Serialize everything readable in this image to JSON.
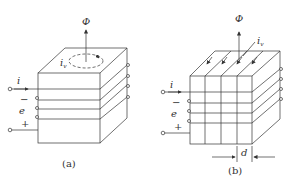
{
  "figures": [
    {
      "id": "a",
      "caption": "(a)",
      "flux_label": "Φ",
      "eddy_label": "i",
      "eddy_sub": "v",
      "current_label": "i",
      "emf_label": "e",
      "minus_label": "−",
      "plus_label": "+",
      "description": "Solid core with single large eddy current loop on top face"
    },
    {
      "id": "b",
      "caption": "(b)",
      "flux_label": "Φ",
      "eddy_label": "i",
      "eddy_sub": "v",
      "current_label": "i",
      "emf_label": "e",
      "minus_label": "−",
      "plus_label": "+",
      "dimension_label": "d",
      "description": "Laminated core with small eddy currents in each lamination"
    }
  ],
  "colors": {
    "line": "#333333",
    "background": "#ffffff"
  }
}
